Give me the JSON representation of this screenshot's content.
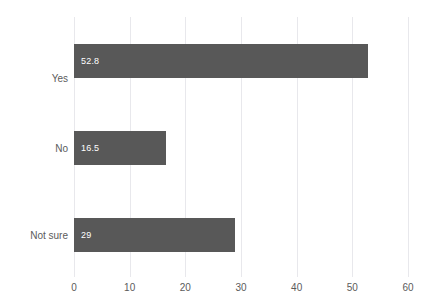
{
  "chart_data": {
    "type": "bar",
    "orientation": "horizontal",
    "title": "",
    "xlabel": "",
    "ylabel": "",
    "categories": [
      "Yes",
      "No",
      "Not sure"
    ],
    "values": [
      52.8,
      16.5,
      29
    ],
    "value_labels": [
      "52.8",
      "16.5",
      "29"
    ],
    "xlim": [
      0,
      60
    ],
    "xticks": [
      0,
      10,
      20,
      30,
      40,
      50,
      60
    ],
    "xtick_labels": [
      "0",
      "10",
      "20",
      "30",
      "40",
      "50",
      "60"
    ],
    "grid": true,
    "grid_axis": "x",
    "legend": false,
    "series": [
      {
        "name": "Response share",
        "values": [
          52.8,
          16.5,
          29
        ]
      }
    ],
    "colors": {
      "bar": "#585858",
      "grid": "#e8e8ec",
      "value_label": "#ffffff",
      "axis_text": "#5b5b5b",
      "background": "#ffffff"
    }
  }
}
